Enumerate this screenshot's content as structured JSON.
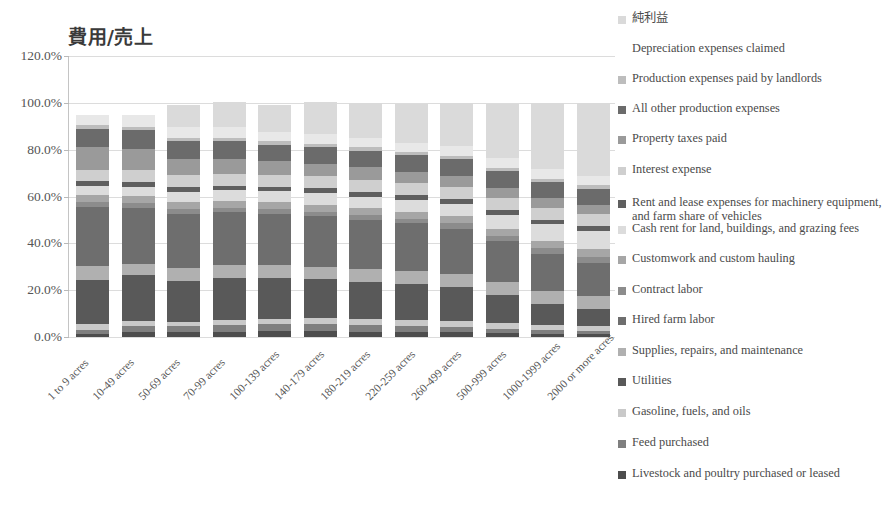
{
  "chart_data": {
    "type": "bar",
    "subtype": "stacked-bar-100",
    "title": "費用/売上",
    "xlabel": "",
    "ylabel": "",
    "ylim": [
      0,
      120
    ],
    "ytick_labels": [
      "0.0%",
      "20.0%",
      "40.0%",
      "60.0%",
      "80.0%",
      "100.0%",
      "120.0%"
    ],
    "ytick_values": [
      0,
      20,
      40,
      60,
      80,
      100,
      120
    ],
    "grid": true,
    "legend_position": "right",
    "categories": [
      "1 to 9 acres",
      "10-49 acres",
      "50-69 acres",
      "70-99 acres",
      "100-139 acres",
      "140-179 acres",
      "180-219 acres",
      "220-259 acres",
      "260-499 acres",
      "500-999 acres",
      "1000-1999 acres",
      "2000 or more acres"
    ],
    "series": [
      {
        "name": "Livestock and poultry purchased or leased",
        "color": "#4d4d4d",
        "values": [
          1.5,
          2.2,
          2.0,
          2.2,
          2.4,
          2.6,
          2.3,
          2.1,
          2.0,
          1.6,
          1.3,
          1.1
        ]
      },
      {
        "name": "Feed purchased",
        "color": "#7f7f7f",
        "values": [
          1.6,
          2.6,
          2.5,
          2.8,
          3.0,
          3.1,
          2.8,
          2.6,
          2.4,
          2.0,
          1.6,
          1.4
        ]
      },
      {
        "name": "Gasoline, fuels, and oils",
        "color": "#c9c9c9",
        "values": [
          2.4,
          2.0,
          2.1,
          2.2,
          2.3,
          2.4,
          2.4,
          2.4,
          2.4,
          2.3,
          2.2,
          2.1
        ]
      },
      {
        "name": "Utilities",
        "color": "#595959",
        "values": [
          19.0,
          19.5,
          17.5,
          18.0,
          17.5,
          16.5,
          16.0,
          15.5,
          14.5,
          12.0,
          9.0,
          7.5
        ]
      },
      {
        "name": "Supplies, repairs, and maintenance",
        "color": "#b0b0b0",
        "values": [
          6.0,
          5.0,
          5.5,
          5.5,
          5.5,
          5.5,
          5.5,
          5.5,
          5.5,
          5.5,
          5.5,
          5.5
        ]
      },
      {
        "name": "Hired farm labor",
        "color": "#6e6e6e",
        "values": [
          25.0,
          24.0,
          23.0,
          22.5,
          22.0,
          21.5,
          21.0,
          20.5,
          19.5,
          17.5,
          16.0,
          14.0
        ]
      },
      {
        "name": "Contract labor",
        "color": "#8c8c8c",
        "values": [
          2.0,
          2.0,
          2.0,
          2.0,
          2.0,
          2.0,
          2.0,
          2.0,
          2.2,
          2.4,
          2.6,
          2.8
        ]
      },
      {
        "name": "Customwork and custom hauling",
        "color": "#a6a6a6",
        "values": [
          3.0,
          3.0,
          3.0,
          3.0,
          3.0,
          3.0,
          3.0,
          3.0,
          3.0,
          3.0,
          3.0,
          3.0
        ]
      },
      {
        "name": "Cash rent for land, buildings, and grazing fees",
        "color": "#dcdcdc",
        "values": [
          4.0,
          4.0,
          4.5,
          4.5,
          4.5,
          5.0,
          5.0,
          5.0,
          5.5,
          6.0,
          7.0,
          8.0
        ]
      },
      {
        "name": "Rent and lease expenses for machinery equipment, and farm share of vehicles",
        "color": "#5f5f5f",
        "values": [
          2.0,
          2.0,
          2.0,
          2.0,
          2.0,
          2.0,
          2.0,
          2.0,
          2.0,
          2.0,
          2.0,
          2.0
        ]
      },
      {
        "name": "Interest expense",
        "color": "#cfcfcf",
        "values": [
          5.0,
          5.0,
          5.0,
          5.0,
          5.0,
          5.0,
          5.0,
          5.0,
          5.0,
          5.0,
          5.0,
          5.0
        ]
      },
      {
        "name": "Property taxes paid",
        "color": "#9a9a9a",
        "values": [
          9.5,
          9.0,
          7.0,
          6.5,
          6.0,
          5.5,
          5.5,
          5.0,
          5.0,
          4.5,
          4.0,
          4.0
        ]
      },
      {
        "name": "All other production expenses",
        "color": "#6b6b6b",
        "values": [
          8.0,
          8.0,
          7.5,
          7.5,
          7.0,
          7.0,
          7.0,
          7.0,
          7.0,
          7.0,
          7.0,
          7.0
        ]
      },
      {
        "name": "Production expenses paid by landlords",
        "color": "#bdbdbd",
        "values": [
          1.5,
          1.5,
          1.5,
          1.5,
          1.5,
          1.5,
          1.5,
          1.5,
          1.5,
          1.5,
          1.5,
          1.5
        ]
      },
      {
        "name": "Depreciation expenses claimed",
        "color": "#e8e8e8",
        "values": [
          4.5,
          5.2,
          4.5,
          4.5,
          4.0,
          4.0,
          4.0,
          4.0,
          4.0,
          4.0,
          4.0,
          4.0
        ]
      },
      {
        "name": "純利益",
        "color": "#dadada",
        "values": [
          0.0,
          0.0,
          9.4,
          10.8,
          11.3,
          13.9,
          15.0,
          16.4,
          18.5,
          23.2,
          28.3,
          31.1
        ]
      }
    ],
    "legend_entries": [
      {
        "label": "純利益",
        "color": "#dadada",
        "swatch": true
      },
      {
        "label": "Depreciation expenses claimed",
        "color": "#e8e8e8",
        "swatch": false
      },
      {
        "label": "Production expenses paid by landlords",
        "color": "#bdbdbd",
        "swatch": true
      },
      {
        "label": "All other production expenses",
        "color": "#6b6b6b",
        "swatch": true
      },
      {
        "label": "Property taxes paid",
        "color": "#9a9a9a",
        "swatch": true
      },
      {
        "label": "Interest expense",
        "color": "#cfcfcf",
        "swatch": true
      },
      {
        "label": "Rent and lease expenses for machinery equipment, and farm share of vehicles",
        "color": "#5f5f5f",
        "swatch": true
      },
      {
        "label": "Cash rent for land, buildings, and grazing fees",
        "color": "#dcdcdc",
        "swatch": true
      },
      {
        "label": "Customwork and custom hauling",
        "color": "#a6a6a6",
        "swatch": true
      },
      {
        "label": "Contract labor",
        "color": "#8c8c8c",
        "swatch": true
      },
      {
        "label": "Hired farm labor",
        "color": "#6e6e6e",
        "swatch": true
      },
      {
        "label": "Supplies, repairs, and maintenance",
        "color": "#b0b0b0",
        "swatch": true
      },
      {
        "label": "Utilities",
        "color": "#595959",
        "swatch": true
      },
      {
        "label": "Gasoline, fuels, and oils",
        "color": "#c9c9c9",
        "swatch": true
      },
      {
        "label": "Feed purchased",
        "color": "#7f7f7f",
        "swatch": true
      },
      {
        "label": "Livestock and poultry purchased or leased",
        "color": "#4d4d4d",
        "swatch": true
      }
    ],
    "legend_item_tops": [
      12,
      42,
      72,
      102,
      132,
      163,
      196,
      222,
      252,
      283,
      313,
      344,
      374,
      405,
      436,
      467
    ]
  }
}
